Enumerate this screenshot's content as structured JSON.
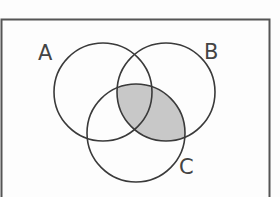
{
  "diagram": {
    "type": "venn",
    "universe": {
      "x": 1.5,
      "y": 19.5,
      "width": 268,
      "height": 190,
      "stroke": "#555555",
      "stroke_width": 2
    },
    "sets": [
      {
        "id": "A",
        "label": "A",
        "cx": 103,
        "cy": 92,
        "r": 49,
        "label_x": 38,
        "label_y": 60
      },
      {
        "id": "B",
        "label": "B",
        "cx": 166,
        "cy": 92,
        "r": 49,
        "label_x": 204,
        "label_y": 59
      },
      {
        "id": "C",
        "label": "C",
        "cx": 136,
        "cy": 133,
        "r": 49,
        "label_x": 179,
        "label_y": 174
      }
    ],
    "shaded_region": {
      "description": "B ∩ C",
      "sets": [
        "B",
        "C"
      ],
      "fill": "#c8c8c8"
    },
    "circle_stroke": "#3a3a3a",
    "circle_stroke_width": 1.6,
    "background": "#fdfdfd"
  }
}
